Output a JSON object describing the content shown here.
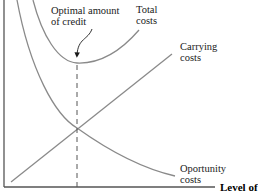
{
  "diagram": {
    "colors": {
      "curve": "#8a8a8a",
      "axis": "#555555",
      "text": "#1a1a1a",
      "background": "#ffffff"
    },
    "labels": {
      "optimal_line1": "Optimal amount",
      "optimal_line2": "of credit",
      "total_line1": "Total",
      "total_line2": "costs",
      "carrying_line1": "Carrying",
      "carrying_line2": "costs",
      "opportunity_line1": "Oportunity",
      "opportunity_line2": "costs",
      "x_axis": "Level of"
    },
    "curves": [
      {
        "name": "Total costs",
        "shape": "U-curve",
        "minimum_at": "optimal amount of credit"
      },
      {
        "name": "Carrying costs",
        "shape": "increasing line"
      },
      {
        "name": "Oportunity costs",
        "shape": "decreasing convex curve"
      }
    ],
    "marker": {
      "name": "Optimal amount of credit",
      "style": "dashed vertical line",
      "at": "intersection of carrying and opportunity costs"
    }
  }
}
